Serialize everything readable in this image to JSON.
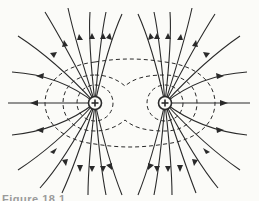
{
  "figure": {
    "charges": [
      {
        "id": "left",
        "x": 95,
        "y": 103,
        "sign": "+",
        "label": "+"
      },
      {
        "id": "right",
        "x": 165,
        "y": 103,
        "sign": "+",
        "label": "+"
      }
    ],
    "colors": {
      "line": "#2a2a2a",
      "background": "#fbfbf8",
      "caption": "#9a9a9a"
    },
    "caption": "Figure 18.1"
  }
}
